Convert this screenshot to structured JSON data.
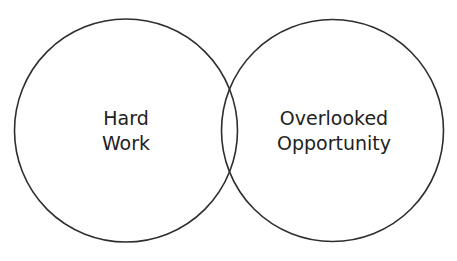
{
  "diagram": {
    "type": "venn",
    "stroke_color": "#2e2e2e",
    "text_color": "#222222",
    "background": "#ffffff",
    "circles": [
      {
        "id": "left",
        "label_lines": [
          "Hard",
          "Work"
        ],
        "cx": 126,
        "cy": 130.5,
        "r": 111.5
      },
      {
        "id": "right",
        "label_lines": [
          "Overlooked",
          "Opportunity"
        ],
        "cx": 332.5,
        "cy": 130.5,
        "r": 111
      }
    ]
  }
}
